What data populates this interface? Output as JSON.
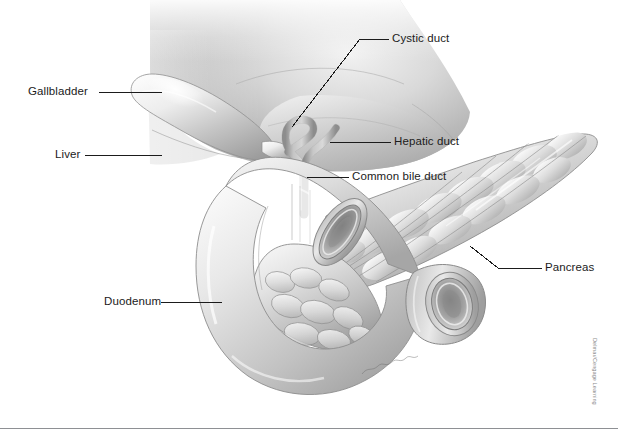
{
  "figure": {
    "style": "grayscale medical line-and-wash illustration",
    "background_color": "#ffffff",
    "label_text_color": "#1b1b1b",
    "leader_line_color": "#1b1b1b",
    "rule_color": "#8e9094",
    "credit_color": "#8a8a8a"
  },
  "labels": [
    {
      "id": "gallbladder",
      "text": "Gallbladder",
      "x": 28,
      "y": 86,
      "align": "right"
    },
    {
      "id": "liver",
      "text": "Liver",
      "x": 55,
      "y": 148,
      "align": "right"
    },
    {
      "id": "cystic-duct",
      "text": "Cystic duct",
      "x": 392,
      "y": 32,
      "align": "left"
    },
    {
      "id": "hepatic-duct",
      "text": "Hepatic duct",
      "x": 394,
      "y": 136,
      "align": "left"
    },
    {
      "id": "common-bile-duct",
      "text": "Common bile duct",
      "x": 352,
      "y": 171,
      "align": "left"
    },
    {
      "id": "pancreas",
      "text": "Pancreas",
      "x": 545,
      "y": 260,
      "align": "left"
    },
    {
      "id": "duodenum",
      "text": "Duodenum",
      "x": 104,
      "y": 296,
      "align": "right"
    }
  ],
  "organs": [
    {
      "id": "liver",
      "name": "Liver"
    },
    {
      "id": "gallbladder",
      "name": "Gallbladder"
    },
    {
      "id": "cystic-duct",
      "name": "Cystic duct"
    },
    {
      "id": "hepatic-duct",
      "name": "Hepatic duct"
    },
    {
      "id": "common-bile-duct",
      "name": "Common bile duct"
    },
    {
      "id": "duodenum",
      "name": "Duodenum"
    },
    {
      "id": "pancreas",
      "name": "Pancreas"
    }
  ],
  "credit": {
    "text": "Delmar/Cengage Learning"
  },
  "signature": {
    "text": ""
  }
}
